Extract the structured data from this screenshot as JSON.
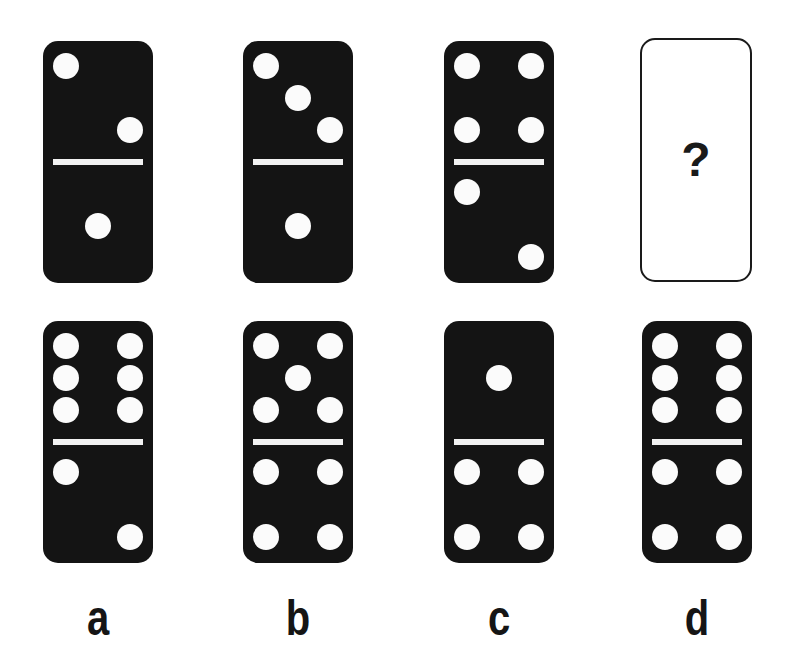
{
  "puzzle": {
    "top_row": [
      {
        "id": "a",
        "top": 2,
        "bottom": 1
      },
      {
        "id": "b",
        "top": 3,
        "bottom": 1
      },
      {
        "id": "c",
        "top": 4,
        "bottom": 2
      },
      {
        "id": "d",
        "unknown": true,
        "symbol": "?"
      }
    ],
    "bottom_row": [
      {
        "id": "a",
        "top": 6,
        "bottom": 2
      },
      {
        "id": "b",
        "top": 5,
        "bottom": 4
      },
      {
        "id": "c",
        "top": 1,
        "bottom": 4
      },
      {
        "id": "d",
        "top": 6,
        "bottom": 4
      }
    ],
    "labels": [
      "a",
      "b",
      "c",
      "d"
    ]
  },
  "colors": {
    "domino": "#141414",
    "pip": "#fbfbfb",
    "background": "#ffffff"
  }
}
